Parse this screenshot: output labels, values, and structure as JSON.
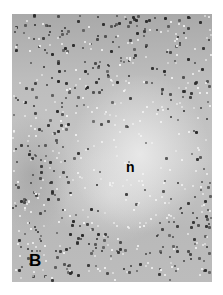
{
  "figure": {
    "panel_label": "B",
    "region_label": "n",
    "tones": {
      "edge": "#a9a9a9",
      "center": "#e0e0e0",
      "nuclei": "#2a2a2a"
    }
  }
}
